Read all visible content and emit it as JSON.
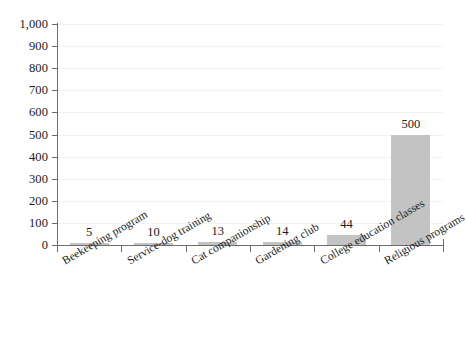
{
  "chart_data": {
    "type": "bar",
    "title": "",
    "subtitle": "",
    "xlabel": "",
    "ylabel": "",
    "categories": [
      "Beekeeping program",
      "Service-dog training",
      "Cat companionship",
      "Gardening club",
      "College education classes",
      "Religious programs"
    ],
    "values": [
      5,
      10,
      13,
      14,
      44,
      500
    ],
    "value_labels": [
      "5",
      "10",
      "13",
      "14",
      "44",
      "500"
    ],
    "ylim": [
      0,
      1000
    ],
    "ytick_step": 100,
    "ytick_labels": [
      "1,000",
      "900",
      "800",
      "700",
      "600",
      "500",
      "400",
      "300",
      "200",
      "100",
      "0"
    ],
    "ytick_values": [
      1000,
      900,
      800,
      700,
      600,
      500,
      400,
      300,
      200,
      100,
      0
    ],
    "grid": true,
    "legend": false,
    "legend_position": "none",
    "bar_color": "#c3c3c3",
    "axis_color": "#6d6d6d",
    "grid_color": "#f2f2f2",
    "text_color": "#1a1a1a",
    "background": "#ffffff",
    "label_rotation_degrees": -30
  }
}
